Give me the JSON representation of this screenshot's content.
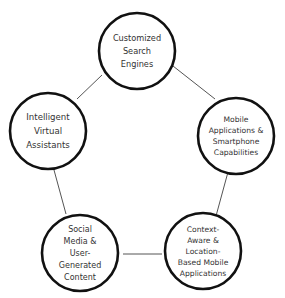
{
  "diagram": {
    "type": "cycle",
    "style": {
      "circle_stroke": "#111111",
      "line_color": "#555555",
      "text_color": "#333333",
      "background": "#ffffff"
    },
    "nodes": [
      {
        "id": "search",
        "lines": [
          "Customized",
          "Search",
          "Engines"
        ]
      },
      {
        "id": "mobile",
        "lines": [
          "Mobile",
          "Applications &",
          "Smartphone",
          "Capabilities"
        ]
      },
      {
        "id": "context",
        "lines": [
          "Context-",
          "Aware &",
          "Location-",
          "Based Mobile",
          "Applications"
        ]
      },
      {
        "id": "social",
        "lines": [
          "Social",
          "Media &",
          "User-",
          "Generated",
          "Content"
        ]
      },
      {
        "id": "assistants",
        "lines": [
          "Intelligent",
          "Virtual",
          "Assistants"
        ]
      }
    ],
    "edges": [
      [
        "search",
        "mobile"
      ],
      [
        "mobile",
        "context"
      ],
      [
        "context",
        "social"
      ],
      [
        "social",
        "assistants"
      ],
      [
        "assistants",
        "search"
      ]
    ]
  }
}
